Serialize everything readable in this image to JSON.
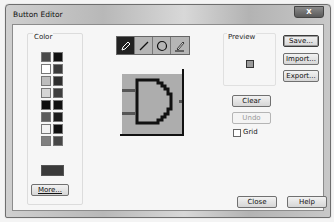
{
  "window": {
    "title": "Button Editor",
    "close_label": "X"
  },
  "color_group": {
    "label": "Color",
    "swatches_left": [
      "#4a4a4a",
      "#ffffff",
      "#bdbdbd",
      "#d5d5d5",
      "#0d0d0d",
      "#5b5b5b",
      "#f2f2f2",
      "#808080"
    ],
    "swatches_right": [
      "#111111",
      "#3a3a3a",
      "#2e2e2e",
      "#3d3d3d",
      "#0f0f0f",
      "#1c1c1c",
      "#101010",
      "#474747"
    ],
    "current_color": "#3a3a3a",
    "more_button": "More..."
  },
  "toolbar": {
    "tools": [
      {
        "name": "pencil",
        "icon": "pencil-icon",
        "active": true
      },
      {
        "name": "line",
        "icon": "line-icon",
        "active": false
      },
      {
        "name": "circle",
        "icon": "circle-icon",
        "active": false
      },
      {
        "name": "fill",
        "icon": "brush-icon",
        "active": false
      }
    ]
  },
  "canvas": {
    "description": "AND gate pixel drawing",
    "background": "#adadad",
    "stroke": "#111111"
  },
  "preview": {
    "label": "Preview"
  },
  "buttons": {
    "save": "Save...",
    "import": "Import...",
    "export": "Export...",
    "clear": "Clear",
    "undo": "Undo",
    "close": "Close",
    "help": "Help"
  },
  "grid_checkbox": {
    "label": "Grid",
    "checked": false
  }
}
